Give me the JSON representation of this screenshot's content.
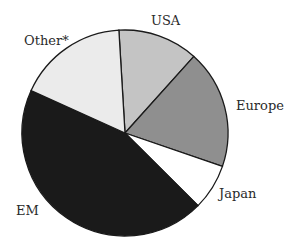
{
  "chart_data": {
    "type": "pie",
    "title": "",
    "categories": [
      "USA",
      "Europe",
      "Japan",
      "EM",
      "Other*"
    ],
    "values": [
      12.6,
      18.6,
      7.2,
      44.3,
      17.3
    ],
    "unit": "percent (estimated from slice angles)",
    "start_angle_deg": -3.4,
    "direction": "clockwise",
    "colors": [
      "#c4c4c4",
      "#8f8f8f",
      "#ffffff",
      "#1a1a1a",
      "#ebebeb"
    ],
    "legend": "none (direct labels)"
  },
  "labels": {
    "usa": "USA",
    "europe": "Europe",
    "japan": "Japan",
    "em": "EM",
    "other": "Other*"
  }
}
